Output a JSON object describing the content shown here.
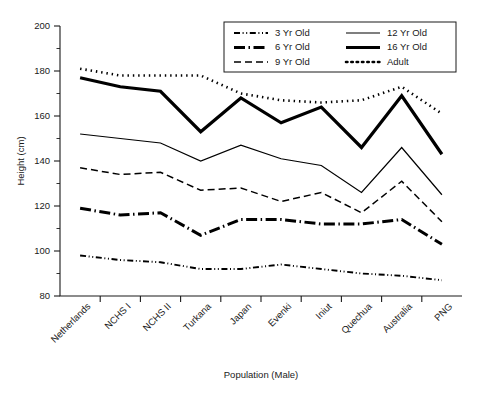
{
  "chart_data": {
    "type": "line",
    "title": "",
    "xlabel": "Population (Male)",
    "ylabel": "Height (cm)",
    "ylim": [
      80,
      200
    ],
    "ytick_step": 20,
    "yminor_step": 10,
    "ytick_labels": [
      "80",
      "100",
      "120",
      "140",
      "160",
      "180",
      "200"
    ],
    "grid": false,
    "legend_position": "top-right",
    "categories": [
      "Netherlands",
      "NCHS I",
      "NCHS II",
      "Turkana",
      "Japan",
      "Evenki",
      "Iniut",
      "Quechua",
      "Australia",
      "PNG"
    ],
    "series": [
      {
        "name": "3 Yr Old",
        "style": "dash-dot-dot",
        "width": 1.9,
        "values": [
          98,
          96,
          95,
          92,
          92,
          94,
          92,
          90,
          89,
          87
        ]
      },
      {
        "name": "6 Yr Old",
        "style": "dash-dot",
        "width": 3.0,
        "values": [
          119,
          116,
          117,
          107,
          114,
          114,
          112,
          112,
          114,
          103
        ]
      },
      {
        "name": "9 Yr Old",
        "style": "dashed",
        "width": 1.5,
        "values": [
          137,
          134,
          135,
          127,
          128,
          122,
          126,
          117,
          131,
          113
        ]
      },
      {
        "name": "12 Yr Old",
        "style": "solid",
        "width": 1.2,
        "values": [
          152,
          150,
          148,
          140,
          147,
          141,
          138,
          126,
          146,
          125
        ]
      },
      {
        "name": "16 Yr Old",
        "style": "solid",
        "width": 3.2,
        "values": [
          177,
          173,
          171,
          153,
          168,
          157,
          164,
          146,
          169,
          143
        ]
      },
      {
        "name": "Adult",
        "style": "dotted",
        "width": 2.6,
        "values": [
          181,
          178,
          178,
          178,
          170,
          167,
          166,
          167,
          173,
          161
        ]
      }
    ],
    "legend_order": [
      "3 Yr Old",
      "12 Yr Old",
      "6 Yr Old",
      "16 Yr Old",
      "9 Yr Old",
      "Adult"
    ]
  },
  "colors": {
    "ink": "#000000",
    "axis": "#1a1a1a",
    "background": "#ffffff"
  }
}
